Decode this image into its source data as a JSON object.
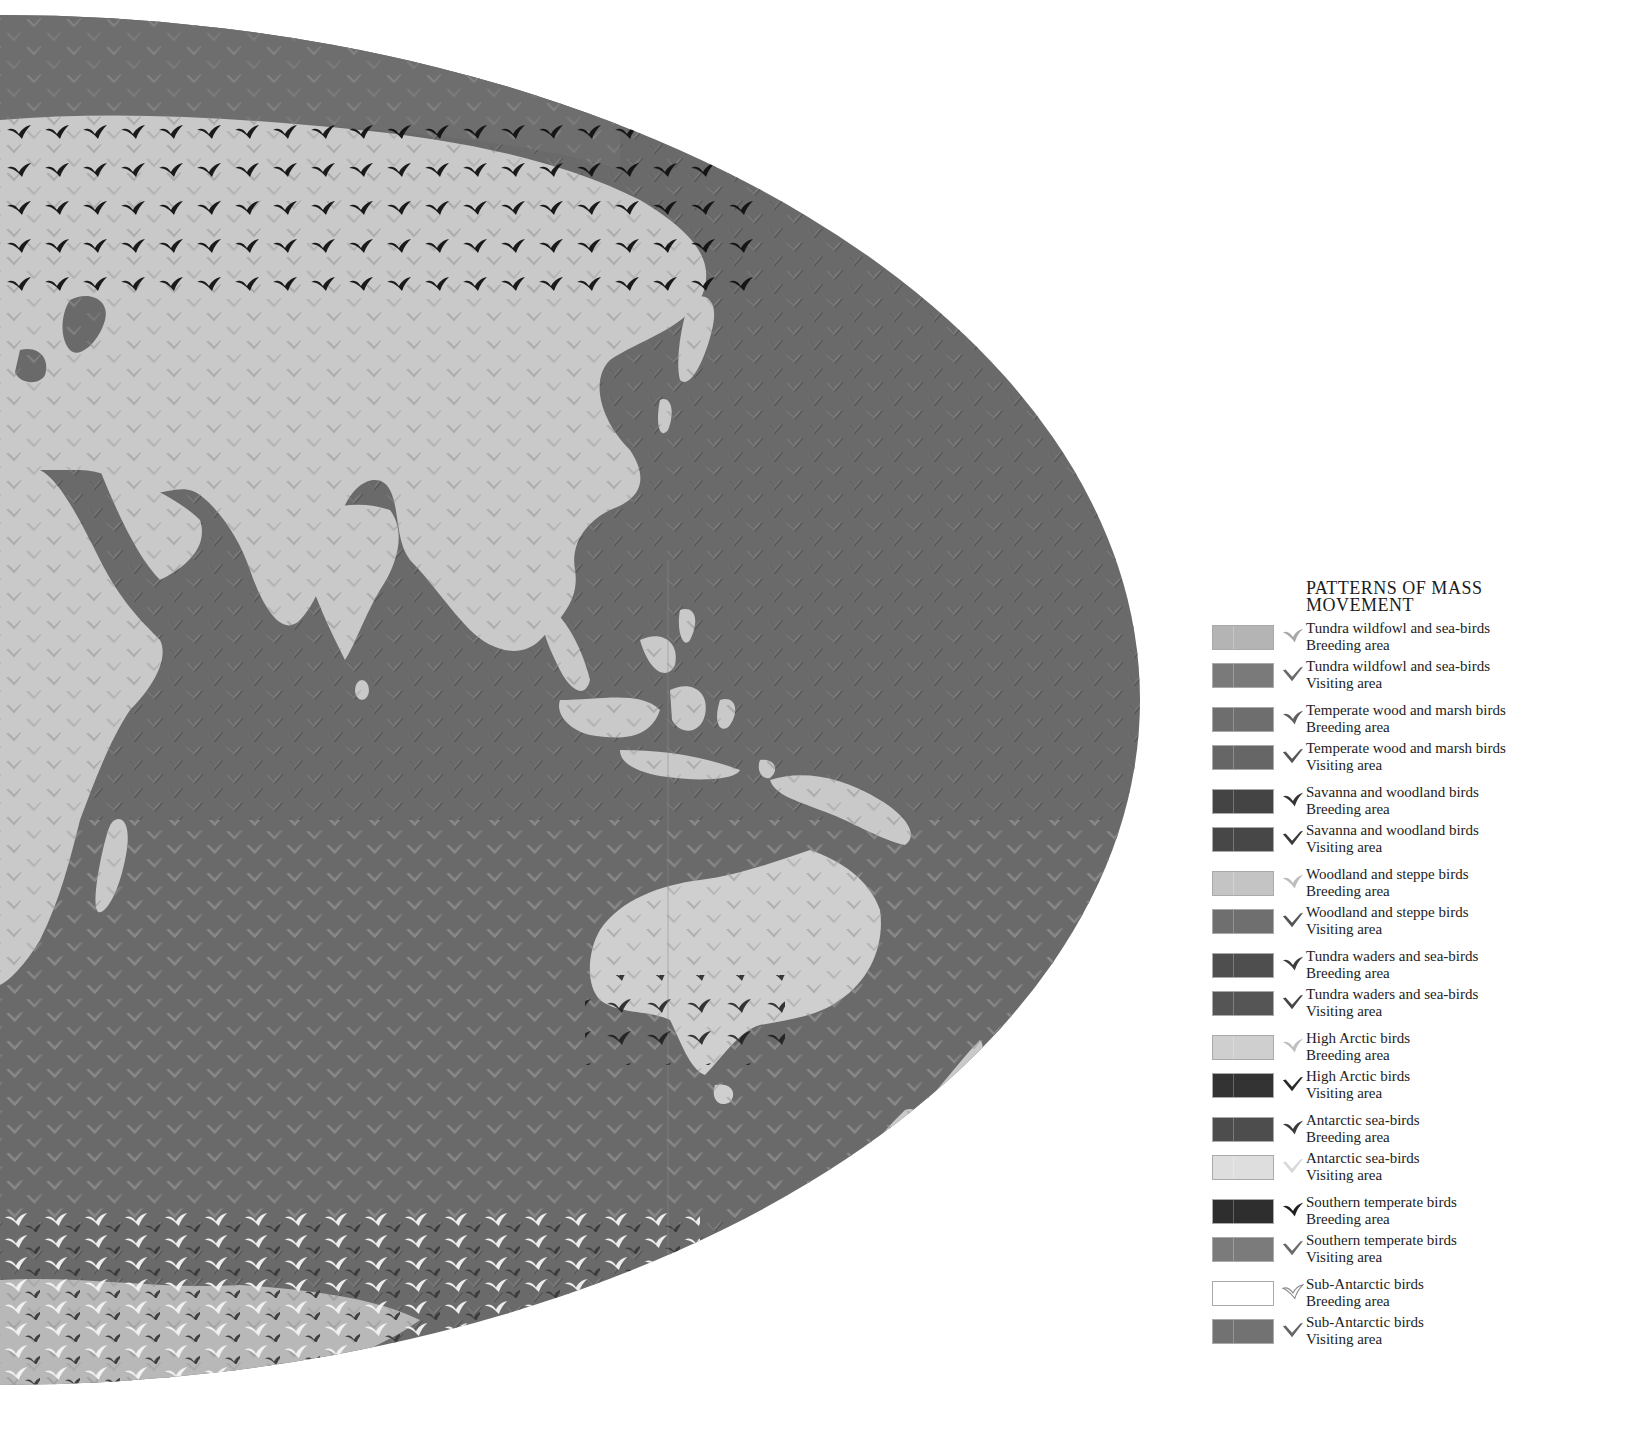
{
  "legend": {
    "title_line1": "PATTERNS OF MASS",
    "title_line2": "MOVEMENT",
    "items": [
      {
        "group": "Tundra wildfowl and sea-birds",
        "area": "Breeding area",
        "swatch": "#b4b4b4",
        "bird": "#a8a8a8",
        "bird_style": "solid"
      },
      {
        "group": "Tundra wildfowl and sea-birds",
        "area": "Visiting area",
        "swatch": "#7a7a7a",
        "bird": "#6a6a6a",
        "bird_style": "chevron"
      },
      {
        "group": "Temperate wood and marsh birds",
        "area": "Breeding area",
        "swatch": "#6e6e6e",
        "bird": "#5e5e5e",
        "bird_style": "solid"
      },
      {
        "group": "Temperate wood and marsh birds",
        "area": "Visiting area",
        "swatch": "#666666",
        "bird": "#555555",
        "bird_style": "chevron"
      },
      {
        "group": "Savanna and woodland birds",
        "area": "Breeding area",
        "swatch": "#444444",
        "bird": "#333333",
        "bird_style": "solid"
      },
      {
        "group": "Savanna and woodland birds",
        "area": "Visiting area",
        "swatch": "#474747",
        "bird": "#3a3a3a",
        "bird_style": "chevron"
      },
      {
        "group": "Woodland and steppe birds",
        "area": "Breeding area",
        "swatch": "#c4c4c4",
        "bird": "#bcbcbc",
        "bird_style": "solid"
      },
      {
        "group": "Woodland and steppe birds",
        "area": "Visiting area",
        "swatch": "#6f6f6f",
        "bird": "#555555",
        "bird_style": "chevron"
      },
      {
        "group": "Tundra waders and sea-birds",
        "area": "Breeding area",
        "swatch": "#4e4e4e",
        "bird": "#3c3c3c",
        "bird_style": "solid"
      },
      {
        "group": "Tundra waders and sea-birds",
        "area": "Visiting area",
        "swatch": "#555555",
        "bird": "#454545",
        "bird_style": "chevron"
      },
      {
        "group": "High Arctic birds",
        "area": "Breeding area",
        "swatch": "#cfcfcf",
        "bird": "#c0c0c0",
        "bird_style": "solid"
      },
      {
        "group": "High Arctic birds",
        "area": "Visiting area",
        "swatch": "#333333",
        "bird": "#2a2a2a",
        "bird_style": "chevron"
      },
      {
        "group": "Antarctic sea-birds",
        "area": "Breeding area",
        "swatch": "#4d4d4d",
        "bird": "#3a3a3a",
        "bird_style": "solid"
      },
      {
        "group": "Antarctic sea-birds",
        "area": "Visiting area",
        "swatch": "#dedede",
        "bird": "#d8d8d8",
        "bird_style": "chevron"
      },
      {
        "group": "Southern temperate birds",
        "area": "Breeding area",
        "swatch": "#2e2e2e",
        "bird": "#1f1f1f",
        "bird_style": "solid"
      },
      {
        "group": "Southern temperate birds",
        "area": "Visiting area",
        "swatch": "#7b7b7b",
        "bird": "#6a6a6a",
        "bird_style": "chevron"
      },
      {
        "group": "Sub-Antarctic birds",
        "area": "Breeding area",
        "swatch": "#ffffff",
        "bird": "#8a8a8a",
        "bird_style": "outline"
      },
      {
        "group": "Sub-Antarctic birds",
        "area": "Visiting area",
        "swatch": "#727272",
        "bird": "#666666",
        "bird_style": "chevron"
      }
    ]
  },
  "map": {
    "ocean_color": "#6a6a6a",
    "land_color": "#c8c8c8",
    "antarctica_color": "#b8b8b8",
    "regions_visible": [
      "Europe (partial)",
      "Africa (partial)",
      "Asia",
      "Indian subcontinent",
      "South-East Asia",
      "Australia",
      "New Zealand",
      "Indian Ocean",
      "Pacific Ocean (west)",
      "Antarctica (partial)"
    ]
  }
}
